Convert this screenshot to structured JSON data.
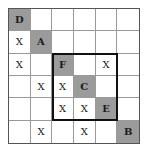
{
  "grid": {
    "rows": 6,
    "cols": 6,
    "shade_color": "#9b9b9b",
    "cells": [
      [
        {
          "t": "D",
          "s": true
        },
        {
          "t": "",
          "s": false
        },
        {
          "t": "",
          "s": false
        },
        {
          "t": "",
          "s": false
        },
        {
          "t": "",
          "s": false
        },
        {
          "t": "",
          "s": false
        }
      ],
      [
        {
          "t": "X",
          "s": false
        },
        {
          "t": "A",
          "s": true
        },
        {
          "t": "",
          "s": false
        },
        {
          "t": "",
          "s": false
        },
        {
          "t": "",
          "s": false
        },
        {
          "t": "",
          "s": false
        }
      ],
      [
        {
          "t": "X",
          "s": false
        },
        {
          "t": "",
          "s": false
        },
        {
          "t": "F",
          "s": true
        },
        {
          "t": "",
          "s": false
        },
        {
          "t": "X",
          "s": false
        },
        {
          "t": "",
          "s": false
        }
      ],
      [
        {
          "t": "",
          "s": false
        },
        {
          "t": "X",
          "s": false
        },
        {
          "t": "X",
          "s": false
        },
        {
          "t": "C",
          "s": true
        },
        {
          "t": "",
          "s": false
        },
        {
          "t": "",
          "s": false
        }
      ],
      [
        {
          "t": "",
          "s": false
        },
        {
          "t": "",
          "s": false
        },
        {
          "t": "X",
          "s": false
        },
        {
          "t": "X",
          "s": false
        },
        {
          "t": "E",
          "s": true
        },
        {
          "t": "",
          "s": false
        }
      ],
      [
        {
          "t": "",
          "s": false
        },
        {
          "t": "X",
          "s": false
        },
        {
          "t": "",
          "s": false
        },
        {
          "t": "X",
          "s": false
        },
        {
          "t": "",
          "s": false
        },
        {
          "t": "B",
          "s": true
        }
      ]
    ],
    "highlight_region": {
      "row_start": 3,
      "row_end": 5,
      "col_start": 3,
      "col_end": 5
    }
  }
}
